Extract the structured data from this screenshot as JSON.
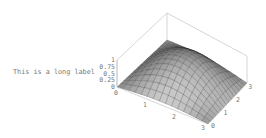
{
  "chart_data": {
    "type": "surface3d",
    "title": "",
    "xlabel": "",
    "ylabel": "",
    "zlabel": "This is a long label",
    "x_ticks": [
      "0",
      "1",
      "2",
      "3"
    ],
    "y_ticks": [
      "0",
      "1",
      "2",
      "3"
    ],
    "z_ticks": [
      "0",
      "0.25",
      "0.5",
      "0.75",
      "1"
    ],
    "xlim": [
      0,
      3.14
    ],
    "ylim": [
      0,
      3.14
    ],
    "zlim": [
      0,
      1
    ],
    "surface": "z = sin(x) * sin(y) approx, peak 1 near center",
    "mesh_lines": 15,
    "box": true,
    "grid": false,
    "colors": {
      "axis": "#bbbbbb",
      "tick_text": "#777777",
      "surface_dark": "#3c3c3c",
      "surface_light": "#d8d8d8",
      "mesh": "#222222"
    }
  },
  "labels": {
    "z_axis": "This is a long label"
  }
}
